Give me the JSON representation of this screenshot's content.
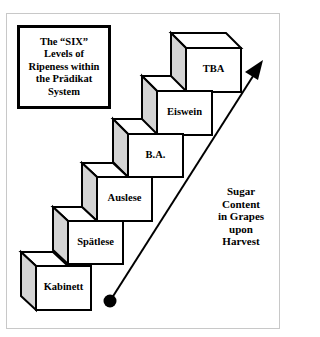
{
  "title": "The “SIX”\nLevels of\nRipeness within\nthe Prädikat\nSystem",
  "levels": [
    {
      "label": "Kabinett"
    },
    {
      "label": "Spätlese"
    },
    {
      "label": "Auslese"
    },
    {
      "label": "B.A."
    },
    {
      "label": "Eiswein"
    },
    {
      "label": "TBA"
    }
  ],
  "arrow_label": "Sugar\nContent\nin Grapes\nupon\nHarvest",
  "colors": {
    "stroke": "#000000",
    "side_shade": "#d4d4d4",
    "face": "#ffffff",
    "frame": "#c8c8c8"
  }
}
